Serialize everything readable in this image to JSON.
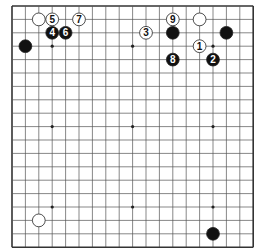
{
  "board": {
    "size": 19,
    "origin_x": 12,
    "origin_y": 6,
    "spacing": 13.4,
    "line_color": "#555555",
    "border_color": "#333333",
    "star_points": [
      [
        3,
        3
      ],
      [
        9,
        3
      ],
      [
        15,
        3
      ],
      [
        3,
        9
      ],
      [
        9,
        9
      ],
      [
        15,
        9
      ],
      [
        3,
        15
      ],
      [
        9,
        15
      ],
      [
        15,
        15
      ]
    ]
  },
  "stones": [
    {
      "color": "white",
      "col": 2,
      "row": 1,
      "label": ""
    },
    {
      "color": "white",
      "col": 3,
      "row": 1,
      "label": "5"
    },
    {
      "color": "white",
      "col": 5,
      "row": 1,
      "label": "7"
    },
    {
      "color": "black",
      "col": 3,
      "row": 2,
      "label": "4"
    },
    {
      "color": "black",
      "col": 4,
      "row": 2,
      "label": "6"
    },
    {
      "color": "black",
      "col": 1,
      "row": 3,
      "label": ""
    },
    {
      "color": "white",
      "col": 10,
      "row": 2,
      "label": "3"
    },
    {
      "color": "white",
      "col": 12,
      "row": 1,
      "label": "9"
    },
    {
      "color": "black",
      "col": 12,
      "row": 2,
      "label": ""
    },
    {
      "color": "white",
      "col": 14,
      "row": 1,
      "label": ""
    },
    {
      "color": "black",
      "col": 16,
      "row": 2,
      "label": ""
    },
    {
      "color": "white",
      "col": 14,
      "row": 3,
      "label": "1"
    },
    {
      "color": "black",
      "col": 12,
      "row": 4,
      "label": "8"
    },
    {
      "color": "black",
      "col": 15,
      "row": 4,
      "label": "2"
    },
    {
      "color": "white",
      "col": 2,
      "row": 16,
      "label": ""
    },
    {
      "color": "black",
      "col": 15,
      "row": 17,
      "label": ""
    }
  ]
}
